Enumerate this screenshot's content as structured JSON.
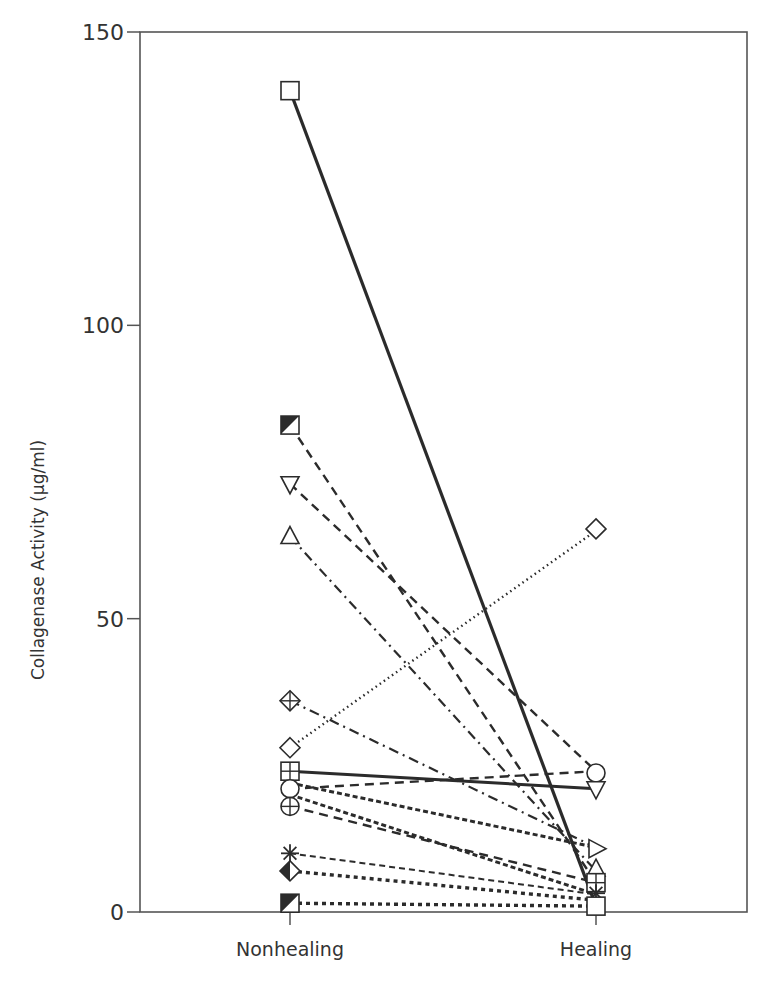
{
  "chart_data": {
    "type": "line",
    "title": "",
    "xlabel": "",
    "ylabel": "Collagenase Activity (µg/ml)",
    "categories": [
      "Nonhealing",
      "Healing"
    ],
    "ylim": [
      0,
      150
    ],
    "yticks": [
      0,
      50,
      100,
      150
    ],
    "grid": false,
    "legend": null,
    "series": [
      {
        "name": "square",
        "marker": "square",
        "style": "solid-thick",
        "values": [
          140,
          1
        ]
      },
      {
        "name": "half-filled-square-high",
        "marker": "half-square",
        "style": "dashed",
        "values": [
          83,
          5
        ]
      },
      {
        "name": "down-triangle",
        "marker": "triangle-down",
        "style": "dashed",
        "values": [
          73,
          24
        ]
      },
      {
        "name": "up-triangle",
        "marker": "triangle-up",
        "style": "dash-dot",
        "values": [
          64,
          7
        ]
      },
      {
        "name": "diamond-plus",
        "marker": "diamond-plus",
        "style": "dash-dot",
        "values": [
          36,
          11
        ]
      },
      {
        "name": "diamond",
        "marker": "diamond",
        "style": "dotted",
        "values": [
          28,
          65
        ]
      },
      {
        "name": "square-plus",
        "marker": "square-plus",
        "style": "solid",
        "values": [
          24,
          21
        ]
      },
      {
        "name": "circle",
        "marker": "circle",
        "style": "dashed",
        "values": [
          21,
          24
        ]
      },
      {
        "name": "circle-b",
        "marker": "none",
        "style": "dense-dashed",
        "values": [
          22,
          11
        ]
      },
      {
        "name": "circle-c",
        "marker": "none",
        "style": "dense-dashed",
        "values": [
          20,
          3
        ]
      },
      {
        "name": "circle-plus",
        "marker": "circle-plus",
        "style": "dashed",
        "values": [
          18,
          5
        ]
      },
      {
        "name": "asterisk",
        "marker": "asterisk",
        "style": "dashed-fine",
        "values": [
          10,
          3
        ]
      },
      {
        "name": "half-diamond",
        "marker": "half-diamond",
        "style": "dotted-thick",
        "values": [
          7,
          2
        ]
      },
      {
        "name": "half-filled-square-low",
        "marker": "half-square",
        "style": "dotted-thick",
        "values": [
          1.5,
          1
        ]
      }
    ]
  },
  "axis": {
    "y_title": "Collagenase Activity (µg/ml)",
    "y_ticks": [
      "0",
      "50",
      "100",
      "150"
    ],
    "x_ticks": [
      "Nonhealing",
      "Healing"
    ]
  }
}
